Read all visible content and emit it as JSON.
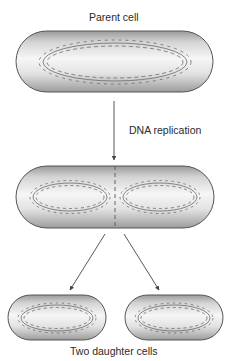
{
  "diagram": {
    "labels": {
      "parent": "Parent cell",
      "process": "DNA replication",
      "result": "Two daughter cells"
    },
    "nodes": [
      {
        "id": "parent-cell",
        "shape": "capsule",
        "chromosomes": 1
      },
      {
        "id": "dividing-cell",
        "shape": "capsule",
        "chromosomes": 2,
        "division_line": "dashed"
      },
      {
        "id": "daughter-cell-left",
        "shape": "capsule",
        "chromosomes": 1
      },
      {
        "id": "daughter-cell-right",
        "shape": "capsule",
        "chromosomes": 1
      }
    ],
    "edges": [
      {
        "from": "parent-cell",
        "to": "dividing-cell",
        "label": "DNA replication"
      },
      {
        "from": "dividing-cell",
        "to": "daughter-cell-left"
      },
      {
        "from": "dividing-cell",
        "to": "daughter-cell-right"
      }
    ],
    "colors": {
      "cell_fill_light": "#f4f4f4",
      "cell_fill_dark": "#a8a8a8",
      "outline": "#555555",
      "dna": "#6a6a6a",
      "text": "#2a2a2a"
    }
  }
}
